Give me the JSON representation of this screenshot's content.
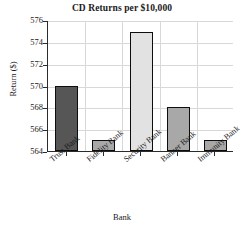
{
  "chart_data": {
    "type": "bar",
    "title": "CD Returns per $10,000",
    "xlabel": "Bank",
    "ylabel": "Return ($)",
    "categories": [
      "Trust Bank",
      "Fidelity Bank",
      "Security Bank",
      "Banner Bank",
      "Immunity Bank"
    ],
    "values": [
      570,
      565,
      574.9,
      568,
      565
    ],
    "ylim": [
      564,
      576
    ],
    "yticks": [
      564,
      566,
      568,
      570,
      572,
      574,
      576
    ],
    "ytick_labels": [
      "564",
      "566",
      "568",
      "570",
      "572",
      "574",
      "576"
    ],
    "grid": true,
    "legend": "none",
    "bar_colors": [
      "#565656",
      "#a8a8a8",
      "#e2e2e2",
      "#a8a8a8",
      "#a8a8a8"
    ],
    "bar_edge_color": "#0d0d0d",
    "gridline_color": "#d8d8d8",
    "axis_color": "#2b2b2b",
    "background": "#ffffff"
  }
}
